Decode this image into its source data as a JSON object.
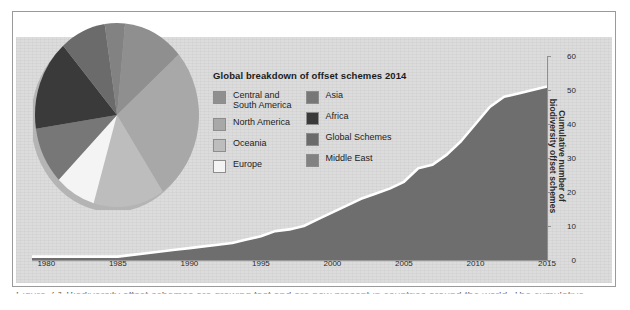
{
  "figure": {
    "caption": "Figure 7.1  Biodiversity offset schemes are growing fast and are now present in countries around the world. The cumulative"
  },
  "legend": {
    "title": "Global breakdown of offset schemes 2014",
    "columns": [
      {
        "items": [
          {
            "label": "Central and\nSouth America",
            "color": "#8f8f8f"
          },
          {
            "label": "North America",
            "color": "#a8a8a8"
          },
          {
            "label": "Oceania",
            "color": "#bdbdbd"
          },
          {
            "label": "Europe",
            "color": "#f4f4f4"
          }
        ]
      },
      {
        "items": [
          {
            "label": "Asia",
            "color": "#777777"
          },
          {
            "label": "Africa",
            "color": "#3a3a3a"
          },
          {
            "label": "Global Schemes",
            "color": "#6b6b6b"
          },
          {
            "label": "Middle East",
            "color": "#828282"
          }
        ]
      }
    ]
  },
  "axes": {
    "x_ticks": [
      "1980",
      "1985",
      "1990",
      "1995",
      "2000",
      "2005",
      "2010",
      "2015"
    ],
    "y_ticks": [
      "0",
      "10",
      "20",
      "30",
      "40",
      "50",
      "60"
    ],
    "y_title": "Cumulative number of\nbiodiversity offset schemes"
  },
  "colors": {
    "panel_background": "#dcdcdc",
    "area_fill": "#6e6e6e",
    "area_line": "#ffffff",
    "axis": "#8f8f8f",
    "text": "#1d1d1d"
  },
  "chart_data": [
    {
      "type": "area",
      "title": "",
      "xlabel": "",
      "ylabel": "Cumulative number of biodiversity offset schemes",
      "xlim": [
        1979,
        2015
      ],
      "ylim": [
        0,
        60
      ],
      "grid": false,
      "legend_position": "none",
      "x": [
        1979,
        1980,
        1981,
        1982,
        1983,
        1984,
        1985,
        1986,
        1987,
        1988,
        1989,
        1990,
        1991,
        1992,
        1993,
        1994,
        1995,
        1996,
        1997,
        1998,
        1999,
        2000,
        2001,
        2002,
        2003,
        2004,
        2005,
        2006,
        2007,
        2008,
        2009,
        2010,
        2011,
        2012,
        2013,
        2014,
        2015
      ],
      "values": [
        1,
        1,
        1,
        1,
        1,
        1,
        1,
        1.5,
        2,
        2.5,
        3,
        3.5,
        4,
        4.5,
        5,
        6,
        7,
        8.5,
        9,
        10,
        12,
        14,
        16,
        18,
        19.5,
        21,
        23,
        27,
        28,
        31,
        35,
        40,
        45,
        48,
        49,
        50,
        51
      ]
    },
    {
      "type": "pie",
      "title": "Global breakdown of offset schemes 2014",
      "labels": [
        "Central and South America",
        "North America",
        "Oceania",
        "Europe",
        "Asia",
        "Africa",
        "Global Schemes",
        "Middle East"
      ],
      "values": [
        12,
        27,
        14,
        8,
        10,
        16,
        9,
        4
      ],
      "colors": [
        "#8f8f8f",
        "#a8a8a8",
        "#bdbdbd",
        "#f4f4f4",
        "#777777",
        "#3a3a3a",
        "#6b6b6b",
        "#828282"
      ],
      "legend_position": "right"
    }
  ]
}
